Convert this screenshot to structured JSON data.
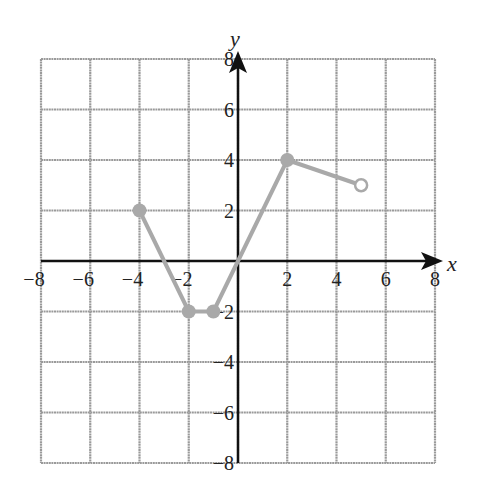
{
  "chart_data": {
    "type": "line",
    "title": "",
    "xlabel": "x",
    "ylabel": "y",
    "xlim": [
      -8,
      8
    ],
    "ylim": [
      -8,
      8
    ],
    "grid": true,
    "grid_step": 2,
    "x_ticks": [
      -8,
      -6,
      -4,
      -2,
      2,
      4,
      6,
      8
    ],
    "y_ticks": [
      -8,
      -6,
      -4,
      -2,
      2,
      4,
      6,
      8
    ],
    "x_tick_labels": [
      "−8",
      "−6",
      "−4",
      "−2",
      "2",
      "4",
      "6",
      "8"
    ],
    "y_tick_labels": [
      "−8",
      "−6",
      "−4",
      "−2",
      "2",
      "4",
      "6",
      "8"
    ],
    "series": [
      {
        "name": "f(x)",
        "color": "#a9a9a9",
        "points": [
          {
            "x": -4,
            "y": 2,
            "marker": "filled"
          },
          {
            "x": -2,
            "y": -2,
            "marker": "filled"
          },
          {
            "x": -1,
            "y": -2,
            "marker": "filled"
          },
          {
            "x": 2,
            "y": 4,
            "marker": "filled"
          },
          {
            "x": 5,
            "y": 3,
            "marker": "open"
          }
        ]
      }
    ],
    "legend": null
  },
  "colors": {
    "grid": "#9a9a9a",
    "axis": "#111111",
    "curve": "#a9a9a9",
    "background": "#ffffff"
  },
  "axes": {
    "x_label": "x",
    "y_label": "y"
  }
}
